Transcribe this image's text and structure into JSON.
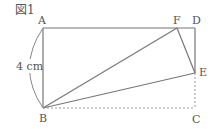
{
  "figure": {
    "title": "図1",
    "points": {
      "A": {
        "label": "A",
        "x": 43,
        "y": 28
      },
      "B": {
        "label": "B",
        "x": 43,
        "y": 108
      },
      "C": {
        "label": "C",
        "x": 195,
        "y": 108
      },
      "D": {
        "label": "D",
        "x": 195,
        "y": 28
      },
      "E": {
        "label": "E",
        "x": 195,
        "y": 73
      },
      "F": {
        "label": "F",
        "x": 177,
        "y": 28
      }
    },
    "dimension_label": "4 cm",
    "colors": {
      "line": "#777777",
      "dotted": "#999999",
      "text": "#555555"
    }
  }
}
